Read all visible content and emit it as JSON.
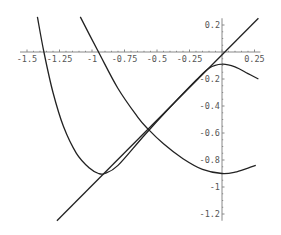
{
  "chart_data": {
    "type": "line",
    "title": "",
    "xlabel": "",
    "ylabel": "",
    "xlim": [
      -1.5,
      0.28
    ],
    "ylim": [
      -1.25,
      0.26
    ],
    "grid": false,
    "legend": null,
    "x_ticks": [
      -1.5,
      -1.25,
      -1,
      -0.75,
      -0.5,
      -0.25,
      0.25
    ],
    "x_tick_labels": [
      "-1.5",
      "-1.25",
      "-1",
      "-0.75",
      "-0.5",
      "-0.25",
      "0.25"
    ],
    "y_ticks": [
      0.2,
      -0.2,
      -0.4,
      -0.6,
      -0.8,
      -1,
      -1.2
    ],
    "y_tick_labels": [
      "0.2",
      "-0.2",
      "-0.4",
      "-0.6",
      "-0.8",
      "-1",
      "-1.2"
    ],
    "series": [
      {
        "name": "line y=x",
        "points": [
          [
            -1.27,
            -1.25
          ],
          [
            0.28,
            0.25
          ]
        ]
      },
      {
        "name": "curve A (steep left, dips then follows line to hump)",
        "points": [
          [
            -1.42,
            0.26
          ],
          [
            -1.37,
            0.0
          ],
          [
            -1.3,
            -0.3
          ],
          [
            -1.22,
            -0.55
          ],
          [
            -1.12,
            -0.75
          ],
          [
            -1.02,
            -0.86
          ],
          [
            -0.95,
            -0.9
          ],
          [
            -0.9,
            -0.9
          ],
          [
            -0.8,
            -0.84
          ],
          [
            -0.6,
            -0.62
          ],
          [
            -0.4,
            -0.41
          ],
          [
            -0.2,
            -0.21
          ],
          [
            -0.1,
            -0.12
          ],
          [
            0.0,
            -0.09
          ],
          [
            0.1,
            -0.11
          ],
          [
            0.2,
            -0.16
          ],
          [
            0.28,
            -0.2
          ]
        ]
      },
      {
        "name": "curve B (descending to right minimum)",
        "points": [
          [
            -1.09,
            0.26
          ],
          [
            -0.95,
            0.0
          ],
          [
            -0.8,
            -0.27
          ],
          [
            -0.65,
            -0.48
          ],
          [
            -0.57,
            -0.57
          ],
          [
            -0.45,
            -0.68
          ],
          [
            -0.3,
            -0.79
          ],
          [
            -0.15,
            -0.87
          ],
          [
            0.0,
            -0.9
          ],
          [
            0.1,
            -0.89
          ],
          [
            0.2,
            -0.86
          ],
          [
            0.26,
            -0.84
          ]
        ]
      }
    ]
  }
}
